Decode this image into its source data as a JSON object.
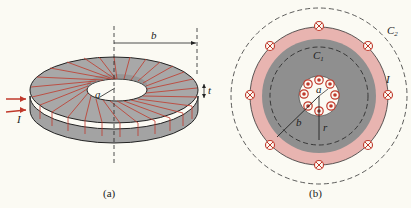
{
  "figure_a": {
    "caption": "(a)",
    "labels": {
      "b": "b",
      "a": "a",
      "t": "t",
      "I": "I"
    },
    "colors": {
      "core": "#9a9a9a",
      "winding": "#c0392b",
      "background": "#fbfaf3"
    }
  },
  "figure_b": {
    "caption": "(b)",
    "labels": {
      "C1": "C",
      "C1_sub": "1",
      "C2": "C",
      "C2_sub": "2",
      "I": "I",
      "a": "a",
      "b": "b",
      "r": "r"
    },
    "colors": {
      "core": "#8f8f8f",
      "ring": "#e8b4b0",
      "conductor": "#c0392b"
    }
  }
}
